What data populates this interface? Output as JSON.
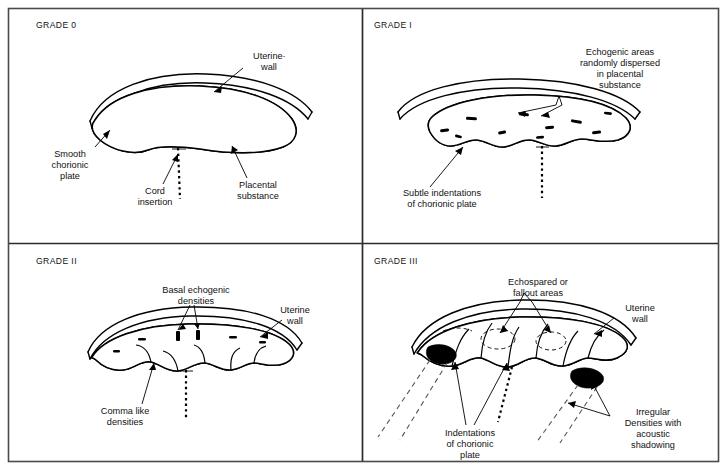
{
  "figure": {
    "border_color": "#4a4a4a",
    "ink_color": "#000000",
    "background": "#ffffff"
  },
  "panels": [
    {
      "id": "grade-0",
      "heading": "GRADE 0",
      "labels": [
        {
          "id": "uterine-wall",
          "lines": [
            "Uterine·",
            "wall"
          ]
        },
        {
          "id": "smooth-chorionic-plate",
          "lines": [
            "Smooth",
            "chorionic",
            "plate"
          ]
        },
        {
          "id": "cord-insertion",
          "lines": [
            "Cord",
            "insertion"
          ]
        },
        {
          "id": "placental-substance",
          "lines": [
            "Placental",
            "substance"
          ]
        }
      ]
    },
    {
      "id": "grade-1",
      "heading": "GRADE I",
      "labels": [
        {
          "id": "echogenic-areas",
          "lines": [
            "Echogenic areas",
            "randomly dispersed",
            "in placental",
            "substance"
          ]
        },
        {
          "id": "subtle-indentations",
          "lines": [
            "Subtle indentations",
            "of chorionic plate"
          ]
        }
      ]
    },
    {
      "id": "grade-2",
      "heading": "GRADE II",
      "labels": [
        {
          "id": "basal-echogenic-densities",
          "lines": [
            "Basal echogenic",
            "densities"
          ]
        },
        {
          "id": "uterine-wall",
          "lines": [
            "Uterine",
            "wall"
          ]
        },
        {
          "id": "comma-like-densities",
          "lines": [
            "Comma like",
            "densities"
          ]
        }
      ]
    },
    {
      "id": "grade-3",
      "heading": "GRADE III",
      "labels": [
        {
          "id": "echospared-fallout-areas",
          "lines": [
            "Echospared or",
            "fallout areas"
          ]
        },
        {
          "id": "uterine-wall",
          "lines": [
            "Uterine",
            "wall"
          ]
        },
        {
          "id": "indentations-chorionic-plate",
          "lines": [
            "Indentations",
            "of chorionic",
            "plate"
          ]
        },
        {
          "id": "irregular-densities",
          "lines": [
            "Irregular",
            "Densities with",
            "acoustic",
            "shadowing"
          ]
        }
      ]
    }
  ]
}
